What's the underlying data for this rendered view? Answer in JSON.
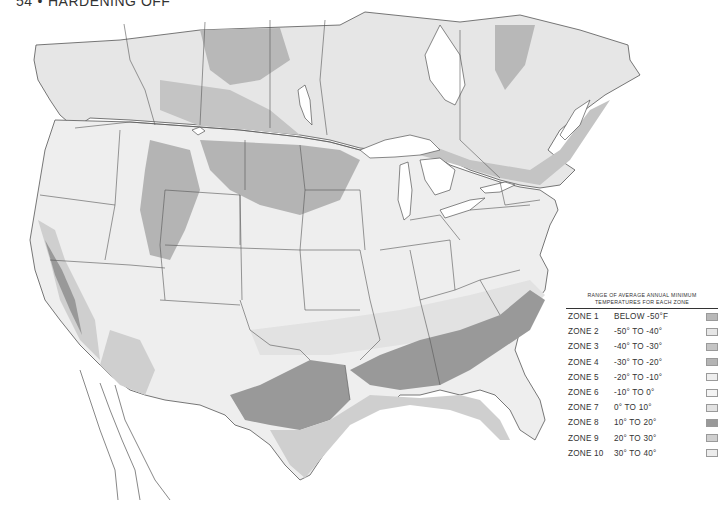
{
  "header": {
    "page_number": "54",
    "separator": "•",
    "section_title": "HARDENING OFF"
  },
  "map": {
    "subject": "Plant hardiness zones of the United States and southern Canada",
    "style": "grayscale",
    "colors": {
      "background": "#ffffff",
      "land_base": "#ececec",
      "water": "#ffffff",
      "borders": "#555555"
    }
  },
  "legend": {
    "title_line1": "RANGE OF AVERAGE ANNUAL MINIMUM",
    "title_line2": "TEMPERATURES FOR EACH ZONE",
    "zones": [
      {
        "name": "ZONE 1",
        "range": "BELOW -50°F",
        "color": "#b8b8b8"
      },
      {
        "name": "ZONE 2",
        "range": "-50° TO -40°",
        "color": "#e6e6e6"
      },
      {
        "name": "ZONE 3",
        "range": "-40° TO -30°",
        "color": "#c4c4c4"
      },
      {
        "name": "ZONE 4",
        "range": "-30° TO -20°",
        "color": "#b4b4b4"
      },
      {
        "name": "ZONE 5",
        "range": "-20° TO -10°",
        "color": "#eeeeee"
      },
      {
        "name": "ZONE 6",
        "range": "-10° TO 0°",
        "color": "#f4f4f4"
      },
      {
        "name": "ZONE 7",
        "range": "0° TO 10°",
        "color": "#e2e2e2"
      },
      {
        "name": "ZONE 8",
        "range": "10° TO 20°",
        "color": "#999999"
      },
      {
        "name": "ZONE 9",
        "range": "20° TO 30°",
        "color": "#cfcfcf"
      },
      {
        "name": "ZONE 10",
        "range": "30° TO 40°",
        "color": "#ececec"
      }
    ]
  }
}
